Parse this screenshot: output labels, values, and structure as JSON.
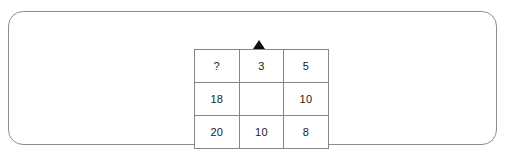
{
  "panel": {
    "border_color": "#8d8d8d",
    "background_color": "#ffffff"
  },
  "pointer": {
    "icon": "up-triangle-marker",
    "glyph": "▲",
    "color": "#0d0d0d",
    "points_to_column_index": 1
  },
  "puzzle": {
    "type": "number-grid",
    "rows": 3,
    "columns": 3,
    "missing_value_symbol": "?",
    "grid": [
      [
        "?",
        "3",
        "5"
      ],
      [
        "18",
        "",
        "10"
      ],
      [
        "20",
        "10",
        "8"
      ]
    ],
    "cells": [
      {
        "row": 0,
        "col": 0,
        "value": "?",
        "empty": false
      },
      {
        "row": 0,
        "col": 1,
        "value": "3",
        "empty": false
      },
      {
        "row": 0,
        "col": 2,
        "value": "5",
        "empty": false
      },
      {
        "row": 1,
        "col": 0,
        "value": "18",
        "empty": false
      },
      {
        "row": 1,
        "col": 1,
        "value": "",
        "empty": true
      },
      {
        "row": 1,
        "col": 2,
        "value": "10",
        "empty": false
      },
      {
        "row": 2,
        "col": 0,
        "value": "20",
        "empty": false
      },
      {
        "row": 2,
        "col": 1,
        "value": "10",
        "empty": false
      },
      {
        "row": 2,
        "col": 2,
        "value": "8",
        "empty": false
      }
    ],
    "border_color": "#868686",
    "text_color": "#1a1a1a"
  }
}
